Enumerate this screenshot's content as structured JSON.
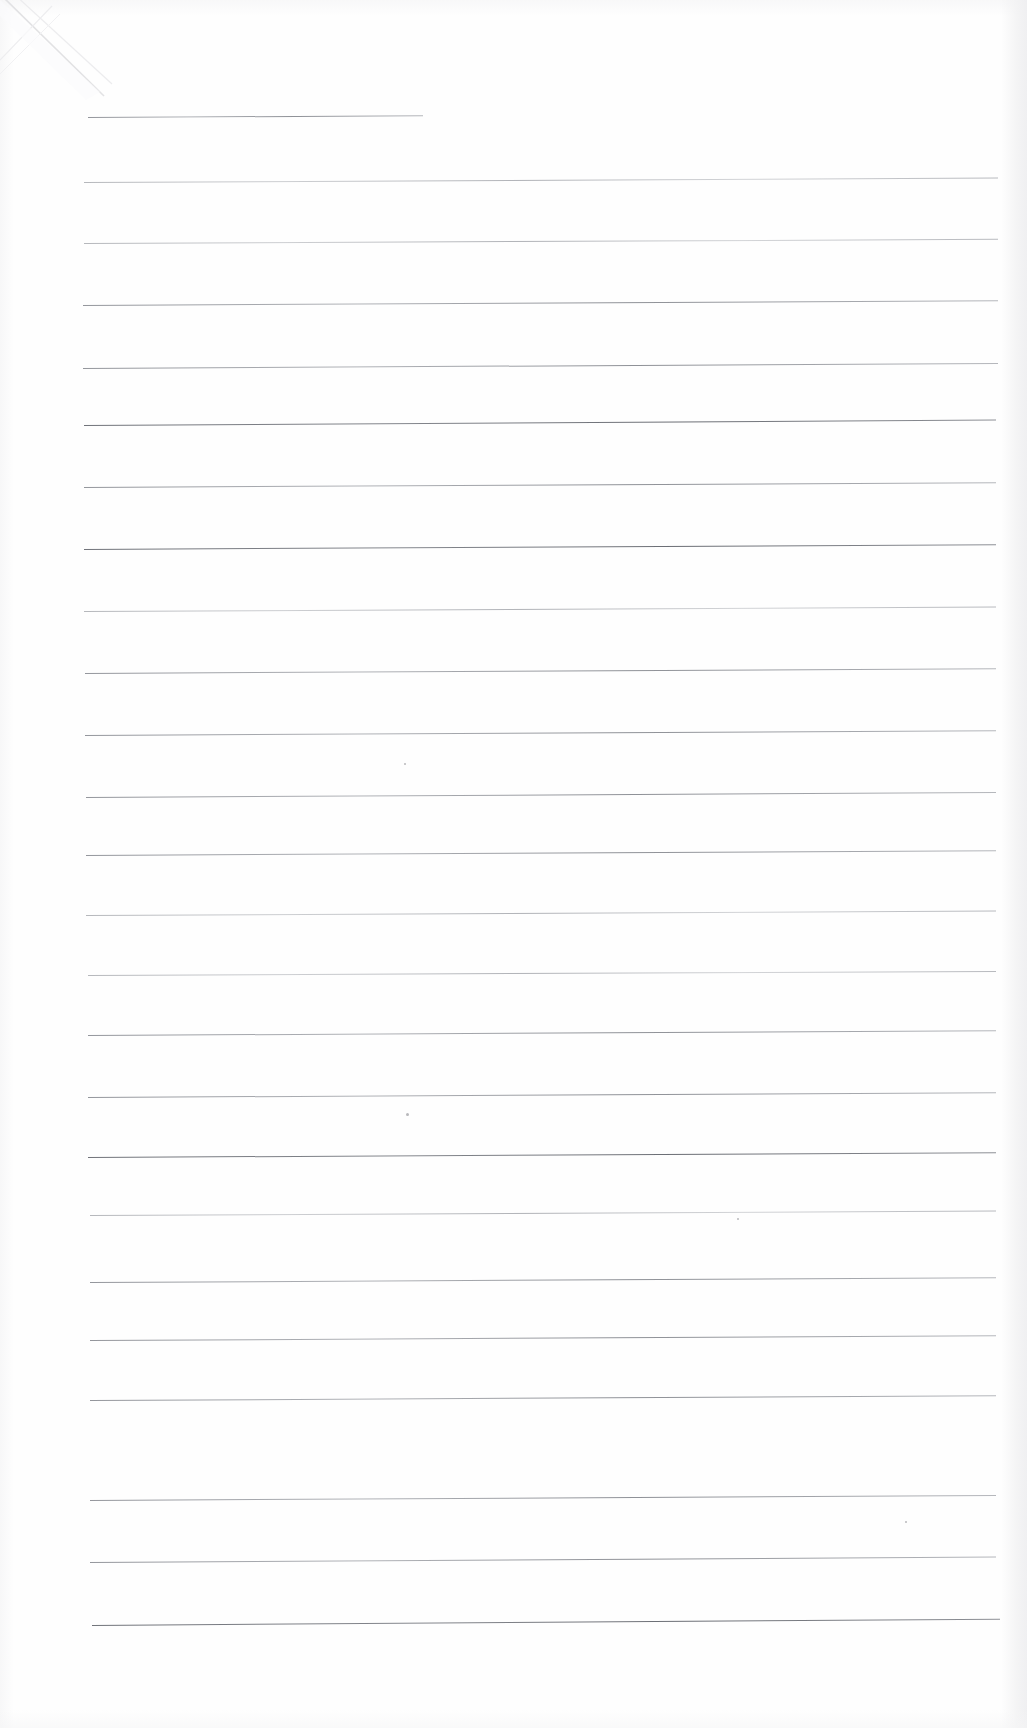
{
  "document": {
    "kind": "scanned-page",
    "title": "Blank Ruled Notepad Page",
    "paper_color": "#fefefe",
    "rule_color": "#8d9096",
    "width_px": 1027,
    "height_px": 1728,
    "visible_text": "",
    "text_content_note": "No printed or handwritten text is present on this page.",
    "artifacts": {
      "corner_crease": "top-left diagonal fold crease",
      "edge_shading": "faint grey scanner shading along page margins",
      "specks": "a few faint dust specks in the lower half"
    },
    "ruling": {
      "line_count": 26,
      "left_margin_x": 85,
      "right_margin_x": 998,
      "nominal_spacing_px": 62,
      "first_line_is_short": true,
      "first_line_end_x": 423,
      "tilt_note": "lines tilt very slightly upward toward the right edge"
    }
  },
  "lines": [
    {
      "index": 1,
      "y": 117,
      "x1": 88,
      "x2": 423,
      "weight": "medium",
      "tilt": -0.3
    },
    {
      "index": 2,
      "y": 182,
      "x1": 84,
      "x2": 998,
      "weight": "faint",
      "tilt": -0.28
    },
    {
      "index": 3,
      "y": 243,
      "x1": 84,
      "x2": 998,
      "weight": "faint",
      "tilt": -0.26
    },
    {
      "index": 4,
      "y": 305,
      "x1": 83,
      "x2": 998,
      "weight": "medium",
      "tilt": -0.3
    },
    {
      "index": 5,
      "y": 368,
      "x1": 83,
      "x2": 998,
      "weight": "medium",
      "tilt": -0.32
    },
    {
      "index": 6,
      "y": 425,
      "x1": 84,
      "x2": 996,
      "weight": "dark",
      "tilt": -0.34
    },
    {
      "index": 7,
      "y": 487,
      "x1": 84,
      "x2": 996,
      "weight": "medium",
      "tilt": -0.3
    },
    {
      "index": 8,
      "y": 549,
      "x1": 84,
      "x2": 996,
      "weight": "dark",
      "tilt": -0.3
    },
    {
      "index": 9,
      "y": 611,
      "x1": 84,
      "x2": 996,
      "weight": "faint",
      "tilt": -0.28
    },
    {
      "index": 10,
      "y": 673,
      "x1": 85,
      "x2": 996,
      "weight": "medium",
      "tilt": -0.3
    },
    {
      "index": 11,
      "y": 735,
      "x1": 85,
      "x2": 996,
      "weight": "medium",
      "tilt": -0.3
    },
    {
      "index": 12,
      "y": 797,
      "x1": 86,
      "x2": 996,
      "weight": "medium",
      "tilt": -0.32
    },
    {
      "index": 13,
      "y": 855,
      "x1": 86,
      "x2": 996,
      "weight": "medium",
      "tilt": -0.3
    },
    {
      "index": 14,
      "y": 915,
      "x1": 86,
      "x2": 996,
      "weight": "faint",
      "tilt": -0.28
    },
    {
      "index": 15,
      "y": 975,
      "x1": 88,
      "x2": 996,
      "weight": "faint",
      "tilt": -0.26
    },
    {
      "index": 16,
      "y": 1035,
      "x1": 88,
      "x2": 996,
      "weight": "medium",
      "tilt": -0.3
    },
    {
      "index": 17,
      "y": 1060,
      "x1": 88,
      "x2": 996,
      "weight": "none",
      "tilt": 0,
      "hidden": true
    },
    {
      "index": 18,
      "y": 1097,
      "x1": 88,
      "x2": 996,
      "weight": "medium",
      "tilt": -0.3
    },
    {
      "index": 19,
      "y": 1157,
      "x1": 88,
      "x2": 996,
      "weight": "dark",
      "tilt": -0.3
    },
    {
      "index": 20,
      "y": 1215,
      "x1": 90,
      "x2": 996,
      "weight": "faint",
      "tilt": -0.28
    },
    {
      "index": 21,
      "y": 1252,
      "x1": 90,
      "x2": 996,
      "weight": "none",
      "tilt": 0,
      "hidden": true
    },
    {
      "index": 22,
      "y": 1282,
      "x1": 90,
      "x2": 996,
      "weight": "medium",
      "tilt": -0.3
    },
    {
      "index": 23,
      "y": 1340,
      "x1": 90,
      "x2": 996,
      "weight": "medium",
      "tilt": -0.3
    },
    {
      "index": 24,
      "y": 1400,
      "x1": 90,
      "x2": 996,
      "weight": "medium",
      "tilt": -0.3
    },
    {
      "index": 25,
      "y": 1440,
      "x1": 90,
      "x2": 996,
      "weight": "none",
      "tilt": 0,
      "hidden": true
    },
    {
      "index": 26,
      "y": 1500,
      "x1": 90,
      "x2": 996,
      "weight": "medium",
      "tilt": -0.32
    },
    {
      "index": 27,
      "y": 1562,
      "x1": 90,
      "x2": 996,
      "weight": "medium",
      "tilt": -0.34
    },
    {
      "index": 28,
      "y": 1625,
      "x1": 92,
      "x2": 1000,
      "weight": "dark",
      "tilt": -0.4
    }
  ],
  "specks": [
    {
      "x": 404,
      "y": 763,
      "size": 2
    },
    {
      "x": 406,
      "y": 1113,
      "size": 3
    },
    {
      "x": 737,
      "y": 1218,
      "size": 2
    },
    {
      "x": 905,
      "y": 1521,
      "size": 2
    }
  ]
}
